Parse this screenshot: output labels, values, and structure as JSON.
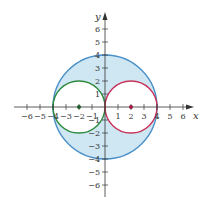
{
  "figure": {
    "type": "circle-region-diagram",
    "axes": {
      "x_label": "x",
      "y_label": "y",
      "x_ticks": [
        -6,
        -5,
        -4,
        -3,
        -2,
        -1,
        1,
        2,
        3,
        4,
        5,
        6
      ],
      "y_ticks": [
        -6,
        -5,
        -4,
        -3,
        -2,
        -1,
        1,
        2,
        3,
        4,
        5,
        6
      ],
      "x_tick_labels": {
        "n6": "−6",
        "n5": "−5",
        "n4": "−4",
        "n3": "−3",
        "n2": "−2",
        "n1": "−1",
        "p1": "1",
        "p2": "2",
        "p3": "3",
        "p4": "4",
        "p5": "5",
        "p6": "6"
      },
      "y_tick_labels": {
        "n6": "−6",
        "n5": "−5",
        "n4": "−4",
        "n3": "−3",
        "n2": "−2",
        "n1": "−1",
        "p1": "1",
        "p2": "2",
        "p3": "3",
        "p4": "4",
        "p5": "5",
        "p6": "6"
      },
      "range": [
        -6.5,
        6.5
      ]
    },
    "curves": [
      {
        "name": "large-circle",
        "center": [
          0,
          0
        ],
        "radius": 4,
        "color": "#4a90c8"
      },
      {
        "name": "left-circle",
        "center": [
          -2,
          0
        ],
        "radius": 2,
        "color": "#2e8b3e"
      },
      {
        "name": "right-circle",
        "center": [
          2,
          0
        ],
        "radius": 2,
        "color": "#c8335a"
      }
    ],
    "points": [
      {
        "name": "left-center",
        "x": -2,
        "y": 0,
        "color": "#1f5e2a"
      },
      {
        "name": "right-center",
        "x": 2,
        "y": 0,
        "color": "#a0183e"
      }
    ],
    "shaded_region": {
      "description": "inside large circle, outside both small circles",
      "fill": "#cfe6f3"
    }
  }
}
